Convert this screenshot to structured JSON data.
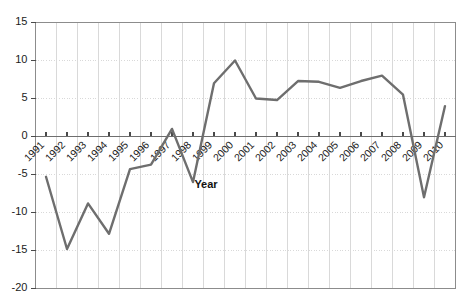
{
  "chart_data": {
    "type": "line",
    "title": "",
    "subtitle": "",
    "xlabel": "Year",
    "ylabel": "",
    "categories": [
      "1991",
      "1992",
      "1993",
      "1994",
      "1995",
      "1996",
      "1997",
      "1998",
      "1999",
      "2000",
      "2001",
      "2002",
      "2003",
      "2004",
      "2005",
      "2006",
      "2007",
      "2008",
      "2009",
      "2010"
    ],
    "values": [
      -5.3,
      -14.8,
      -8.8,
      -12.8,
      -4.3,
      -3.7,
      1.0,
      -6.0,
      7.0,
      10.0,
      5.0,
      4.8,
      7.3,
      7.2,
      6.4,
      7.3,
      8.0,
      5.5,
      -8.0,
      4.0
    ],
    "series": [
      {
        "name": "series-1",
        "values": [
          -5.3,
          -14.8,
          -8.8,
          -12.8,
          -4.3,
          -3.7,
          1.0,
          -6.0,
          7.0,
          10.0,
          5.0,
          4.8,
          7.3,
          7.2,
          6.4,
          7.3,
          8.0,
          5.5,
          -8.0,
          4.0
        ]
      }
    ],
    "ylim": [
      -20,
      15
    ],
    "xlim": [
      1991,
      2010
    ],
    "ytick_labels": [
      "15",
      "10",
      "5",
      "0",
      "-5",
      "-10",
      "-15",
      "-20"
    ],
    "ytick_values": [
      15,
      10,
      5,
      0,
      -5,
      -10,
      -15,
      -20
    ],
    "grid": true,
    "grid_x": true,
    "grid_y": true,
    "legend": false,
    "legend_position": "none",
    "markers": false,
    "zero_line": true,
    "xtick_rotation": -45,
    "colors": {
      "line": "#6e6e6e",
      "grid": "#d9d9d9",
      "axis": "#8c8c8c",
      "zero_line": "#6e6e6e",
      "text": "#1b1b1b",
      "background": "#ffffff",
      "plot_background": "#ffffff"
    },
    "line_width": 2.4
  }
}
